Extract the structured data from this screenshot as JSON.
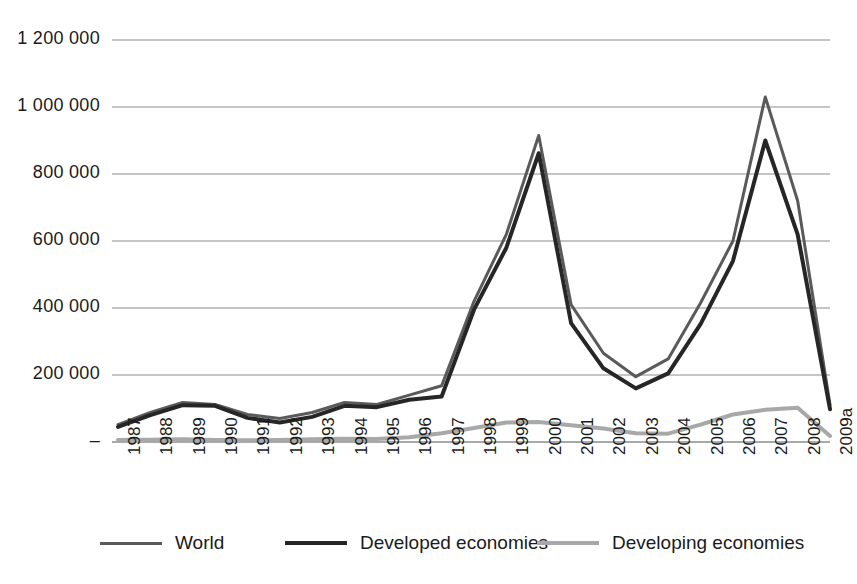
{
  "chart_data": {
    "type": "line",
    "title": "",
    "subtitle": "",
    "xlabel": "",
    "ylabel": "",
    "categories": [
      "1987",
      "1988",
      "1989",
      "1990",
      "1991",
      "1992",
      "1993",
      "1994",
      "1995",
      "1996",
      "1997",
      "1998",
      "1999",
      "2000",
      "2001",
      "2002",
      "2003",
      "2004",
      "2005",
      "2006",
      "2007",
      "2008",
      "2009a"
    ],
    "ytick_labels": [
      "1 200 000",
      "1 000 000",
      "800 000",
      "600 000",
      "400 000",
      "200 000",
      "–"
    ],
    "ytick_values": [
      1200000,
      1000000,
      800000,
      600000,
      400000,
      200000,
      0
    ],
    "ylim": [
      0,
      1250000
    ],
    "grid": true,
    "legend_position": "bottom",
    "series": [
      {
        "name": "World",
        "color": "#5a5a5a",
        "width": 3,
        "values": [
          52000,
          88000,
          118000,
          112000,
          82000,
          70000,
          88000,
          118000,
          112000,
          140000,
          168000,
          420000,
          620000,
          915000,
          410000,
          265000,
          195000,
          248000,
          415000,
          600000,
          1030000,
          720000,
          112000
        ]
      },
      {
        "name": "Developed economies",
        "color": "#262626",
        "width": 4,
        "values": [
          45000,
          80000,
          110000,
          108000,
          72000,
          58000,
          75000,
          108000,
          104000,
          126000,
          136000,
          395000,
          580000,
          862000,
          355000,
          220000,
          160000,
          205000,
          352000,
          540000,
          900000,
          620000,
          98000
        ]
      },
      {
        "name": "Developing economies",
        "color": "#a8a8a8",
        "width": 4,
        "values": [
          6000,
          7000,
          8000,
          6000,
          5000,
          6000,
          8000,
          10000,
          9000,
          14000,
          26000,
          42000,
          58000,
          60000,
          50000,
          40000,
          26000,
          25000,
          52000,
          82000,
          96000,
          102000,
          18000
        ]
      }
    ]
  },
  "legend": {
    "items": [
      {
        "label": "World",
        "color": "#5a5a5a",
        "width": 3
      },
      {
        "label": "Developed economies",
        "color": "#262626",
        "width": 4
      },
      {
        "label": "Developing economies",
        "color": "#a8a8a8",
        "width": 4
      }
    ]
  },
  "axis": {
    "grid_color": "#8c8c8c",
    "zero_tick_label": "–"
  }
}
